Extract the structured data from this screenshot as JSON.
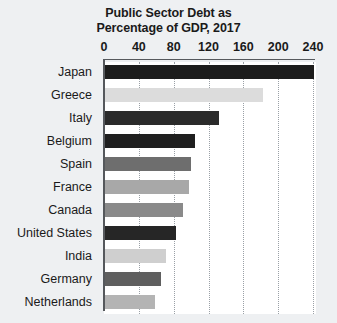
{
  "chart_data": {
    "type": "bar",
    "orientation": "horizontal",
    "title": "Public Sector Debt as Percentage of GDP, 2017",
    "title_lines": [
      "Public Sector Debt as",
      "Percentage of GDP, 2017"
    ],
    "xlabel": "",
    "ylabel": "",
    "xlim": [
      0,
      240
    ],
    "grid": true,
    "grid_style": "dotted",
    "legend": false,
    "xticks": [
      0,
      40,
      80,
      120,
      160,
      200,
      240
    ],
    "xtick_labels": [
      "0",
      "40",
      "80",
      "120",
      "160",
      "200",
      "240"
    ],
    "categories": [
      "Japan",
      "Greece",
      "Italy",
      "Belgium",
      "Spain",
      "France",
      "Canada",
      "United States",
      "India",
      "Germany",
      "Netherlands"
    ],
    "values": [
      240,
      182,
      131,
      103,
      99,
      97,
      90,
      82,
      70,
      64,
      57
    ],
    "bar_colors": [
      "#1c1c1c",
      "#dcdcdc",
      "#2b2b2b",
      "#1f1f1f",
      "#6e6e6e",
      "#a8a8a8",
      "#8a8a8a",
      "#262626",
      "#cfcfcf",
      "#5f5f5f",
      "#b4b4b4"
    ],
    "bars": [
      {
        "category": "Japan",
        "value": 240,
        "color": "#1c1c1c"
      },
      {
        "category": "Greece",
        "value": 182,
        "color": "#dcdcdc"
      },
      {
        "category": "Italy",
        "value": 131,
        "color": "#2b2b2b"
      },
      {
        "category": "Belgium",
        "value": 103,
        "color": "#1f1f1f"
      },
      {
        "category": "Spain",
        "value": 99,
        "color": "#6e6e6e"
      },
      {
        "category": "France",
        "value": 97,
        "color": "#a8a8a8"
      },
      {
        "category": "Canada",
        "value": 90,
        "color": "#8a8a8a"
      },
      {
        "category": "United States",
        "value": 82,
        "color": "#262626"
      },
      {
        "category": "India",
        "value": 70,
        "color": "#cfcfcf"
      },
      {
        "category": "Germany",
        "value": 64,
        "color": "#5f5f5f"
      },
      {
        "category": "Netherlands",
        "value": 57,
        "color": "#b4b4b4"
      }
    ],
    "colors": {
      "background": "#eef0f2",
      "plot_background": "#ffffff",
      "axis": "#55585c",
      "gridline": "#9aa0a6",
      "text": "#1a1a1a"
    }
  }
}
